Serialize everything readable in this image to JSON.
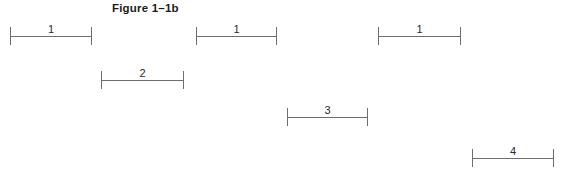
{
  "figure": {
    "title": "Figure 1–1b",
    "background_color": "#ffffff",
    "line_color": "#6e6e6e",
    "label_color": "#2a2a2a",
    "title_color": "#1b1b1b"
  },
  "chart_data": {
    "type": "bar",
    "title": "Figure 1–1b",
    "xlabel": "",
    "ylabel": "",
    "grid": false,
    "legend": null,
    "orientation": "horizontal",
    "categories": [
      "1",
      "1",
      "1",
      "2",
      "3",
      "4"
    ],
    "values": [
      1,
      1,
      1,
      2,
      3,
      4
    ],
    "segments": [
      {
        "label": "1",
        "x_start": 10,
        "x_end": 92,
        "y": 36,
        "pixel_width": 82
      },
      {
        "label": "1",
        "x_start": 196,
        "x_end": 277,
        "y": 36,
        "pixel_width": 81
      },
      {
        "label": "1",
        "x_start": 378,
        "x_end": 461,
        "y": 36,
        "pixel_width": 83
      },
      {
        "label": "2",
        "x_start": 101,
        "x_end": 184,
        "y": 80,
        "pixel_width": 83
      },
      {
        "label": "3",
        "x_start": 287,
        "x_end": 368,
        "y": 117,
        "pixel_width": 81
      },
      {
        "label": "4",
        "x_start": 472,
        "x_end": 554,
        "y": 158,
        "pixel_width": 82
      }
    ]
  }
}
